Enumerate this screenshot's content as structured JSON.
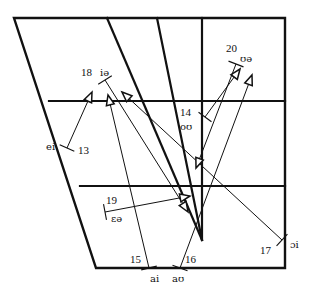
{
  "diagram": {
    "type": "vowel-quadrilateral",
    "colors": {
      "line": "#111111",
      "background": "#ffffff"
    },
    "frame": {
      "outer": [
        [
          14,
          18
        ],
        [
          285,
          18
        ],
        [
          285,
          268
        ],
        [
          96,
          268
        ]
      ],
      "horizontals": [
        {
          "y": 101,
          "x1": 49,
          "x2": 285
        },
        {
          "y": 186,
          "x1": 80,
          "x2": 285
        }
      ],
      "inner_lines": [
        {
          "x1": 107,
          "y1": 18,
          "x2": 202,
          "y2": 240
        },
        {
          "x1": 157,
          "y1": 18,
          "x2": 202,
          "y2": 240
        },
        {
          "x1": 202,
          "y1": 18,
          "x2": 202,
          "y2": 240
        }
      ]
    },
    "diphthongs": [
      {
        "number": "13",
        "symbol": "ei",
        "num_pos": [
          78,
          154
        ],
        "sym_pos": [
          46,
          150
        ],
        "start": [
          67,
          148
        ],
        "end": [
          92,
          92
        ]
      },
      {
        "number": "14",
        "symbol": "oʊ",
        "num_pos": [
          180,
          116
        ],
        "sym_pos": [
          180,
          130
        ],
        "start": [
          205,
          117
        ],
        "end": [
          240,
          69
        ]
      },
      {
        "number": "15",
        "symbol": "ai",
        "num_pos": [
          130,
          263
        ],
        "sym_pos": [
          150,
          282
        ],
        "start": [
          149,
          268
        ],
        "end": [
          108,
          95
        ]
      },
      {
        "number": "16",
        "symbol": "aʊ",
        "num_pos": [
          185,
          263
        ],
        "sym_pos": [
          172,
          282
        ],
        "start": [
          180,
          268
        ],
        "end": [
          252,
          75
        ]
      },
      {
        "number": "17",
        "symbol": "ɔi",
        "num_pos": [
          260,
          254
        ],
        "sym_pos": [
          290,
          248
        ],
        "start": [
          282,
          240
        ],
        "end": [
          122,
          92
        ]
      },
      {
        "number": "18",
        "symbol": "iə",
        "num_pos": [
          81,
          76
        ],
        "sym_pos": [
          100,
          76
        ],
        "start": [
          105,
          80
        ],
        "end": [
          188,
          212
        ]
      },
      {
        "number": "19",
        "symbol": "ɛə",
        "num_pos": [
          106,
          204
        ],
        "sym_pos": [
          111,
          222
        ],
        "start": [
          105,
          212
        ],
        "end": [
          190,
          196
        ]
      },
      {
        "number": "20",
        "symbol": "ʊə",
        "num_pos": [
          226,
          52
        ],
        "sym_pos": [
          240,
          62
        ],
        "start": [
          236,
          64
        ],
        "end": [
          196,
          168
        ]
      }
    ]
  }
}
